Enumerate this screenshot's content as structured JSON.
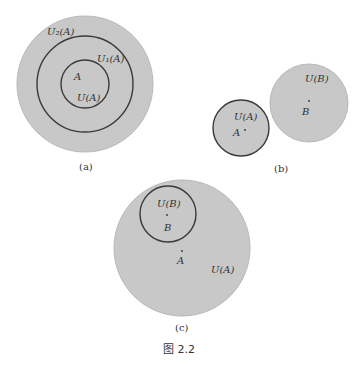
{
  "colors": {
    "fill": "#c8c8c8",
    "stroke_dark": "#3a3a3a",
    "stroke_light": "#b0b0b0",
    "text": "#333333"
  },
  "panel_a": {
    "caption": "(a)",
    "outer_label": "U₂(A)",
    "middle_label": "U₁(A)",
    "inner_label": "U(A)",
    "point_label": "A"
  },
  "panel_b": {
    "caption": "(b)",
    "small_label": "U(A)",
    "small_point": "A",
    "large_label": "U(B)",
    "large_point": "B"
  },
  "panel_c": {
    "caption": "(c)",
    "large_label": "U(A)",
    "large_point": "A",
    "small_label": "U(B)",
    "small_point": "B"
  },
  "figure_caption": "图 2.2"
}
